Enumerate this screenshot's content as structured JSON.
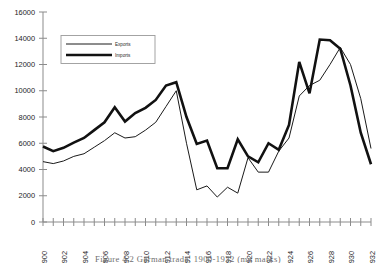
{
  "caption": {
    "text": "Figure 4.2 German trade, 1900-1932 (mn marks)"
  },
  "legend": {
    "exports_label": "Exports",
    "imports_label": "Imports"
  },
  "chart_data": {
    "type": "line",
    "title": "",
    "subtitle": "",
    "xlabel": "",
    "ylabel": "",
    "xlim": [
      1900,
      1932
    ],
    "ylim": [
      0,
      16000
    ],
    "grid": false,
    "legend_position": "upper-left",
    "ytick_labels": [
      "0",
      "2000",
      "4000",
      "6000",
      "8000",
      "10000",
      "12000",
      "14000",
      "16000"
    ],
    "ytick_values": [
      0,
      2000,
      4000,
      6000,
      8000,
      10000,
      12000,
      14000,
      16000
    ],
    "xtick_labels": [
      "1900",
      "1902",
      "1904",
      "1906",
      "1908",
      "1910",
      "1912",
      "1914",
      "1916",
      "1918",
      "1920",
      "1922",
      "1924",
      "1926",
      "1928",
      "1930",
      "1932"
    ],
    "xtick_values": [
      1900,
      1902,
      1904,
      1906,
      1908,
      1910,
      1912,
      1914,
      1916,
      1918,
      1920,
      1922,
      1924,
      1926,
      1928,
      1930,
      1932
    ],
    "x": [
      1900,
      1901,
      1902,
      1903,
      1904,
      1905,
      1906,
      1907,
      1908,
      1909,
      1910,
      1911,
      1912,
      1913,
      1914,
      1915,
      1916,
      1917,
      1918,
      1919,
      1920,
      1921,
      1922,
      1923,
      1924,
      1925,
      1926,
      1927,
      1928,
      1929,
      1930,
      1931,
      1932
    ],
    "series": [
      {
        "name": "Exports",
        "style": "thin",
        "color": "#1a1a1a",
        "values": [
          4600,
          4450,
          4650,
          5000,
          5200,
          5700,
          6200,
          6800,
          6400,
          6500,
          7000,
          7600,
          8800,
          10000,
          6000,
          2450,
          2750,
          1900,
          2650,
          2200,
          4900,
          3800,
          3800,
          5400,
          6400,
          9600,
          10400,
          10800,
          12000,
          13300,
          12000,
          9400,
          5600
        ]
      },
      {
        "name": "Imports",
        "style": "thick",
        "color": "#111111",
        "values": [
          5750,
          5400,
          5650,
          6050,
          6400,
          7000,
          7600,
          8750,
          7650,
          8300,
          8700,
          9300,
          10400,
          10650,
          8000,
          5950,
          6200,
          4100,
          4100,
          6300,
          5000,
          4550,
          6000,
          5500,
          7400,
          12200,
          9800,
          13900,
          13850,
          13200,
          10400,
          6800,
          4400
        ]
      }
    ]
  }
}
